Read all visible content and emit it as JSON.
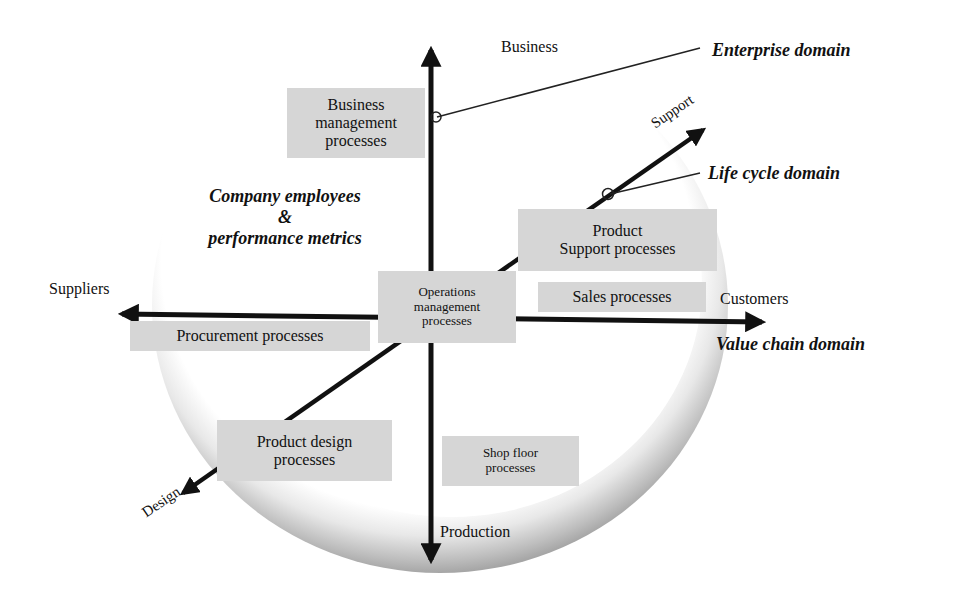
{
  "diagram": {
    "axes": {
      "up": "Business",
      "down": "Production",
      "left": "Suppliers",
      "right": "Customers",
      "diag_up": "Support",
      "diag_down": "Design"
    },
    "domains": {
      "enterprise": "Enterprise domain",
      "life_cycle": "Life cycle domain",
      "value_chain": "Value chain domain"
    },
    "center_note": {
      "line1": "Company employees",
      "line2": "&",
      "line3": "performance metrics"
    },
    "processes": {
      "business_mgmt": [
        "Business",
        "management",
        "processes"
      ],
      "operations_mgmt": [
        "Operations",
        "management",
        "processes"
      ],
      "product_support": [
        "Product",
        "Support processes"
      ],
      "sales": [
        "Sales processes"
      ],
      "procurement": [
        "Procurement processes"
      ],
      "product_design": [
        "Product design",
        "processes"
      ],
      "shop_floor": [
        "Shop floor",
        "processes"
      ]
    },
    "colors": {
      "box_fill": "#d6d6d6",
      "arrow": "#111111",
      "ring_light": "#f2f2f2",
      "ring_dark": "#9a9a9a"
    }
  }
}
